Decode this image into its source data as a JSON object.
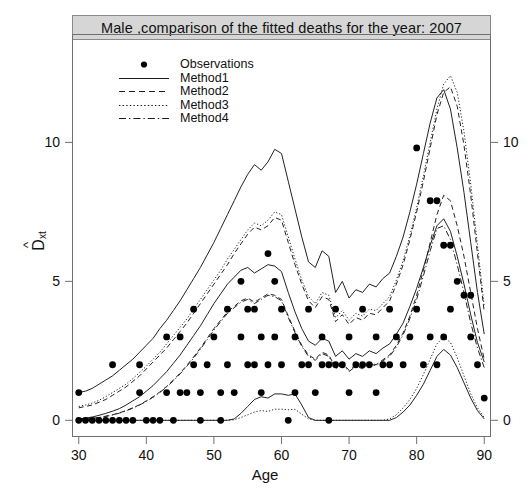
{
  "title": "Male ,comparison of the fitted deaths for the year: 2007",
  "legend": {
    "position": "top-left",
    "entries": [
      {
        "label": "Observations",
        "style": "point"
      },
      {
        "label": "Method1",
        "style": "solid"
      },
      {
        "label": "Method2",
        "style": "dashed"
      },
      {
        "label": "Method3",
        "style": "dotted"
      },
      {
        "label": "Method4",
        "style": "dashdot"
      }
    ]
  },
  "axes": {
    "x": {
      "label": "Age",
      "ticks": [
        30,
        40,
        50,
        60,
        70,
        80,
        90
      ],
      "min": 29,
      "max": 91
    },
    "y": {
      "label": "D_xt",
      "label_display": "D",
      "label_sub": "xt",
      "ticks": [
        0,
        5,
        10
      ],
      "min": -0.6,
      "max": 13.9
    },
    "y_right": {
      "ticks": [
        0,
        5,
        10
      ]
    }
  },
  "colors": {
    "title_bar": "#d6d6d6",
    "frame": "#6f6f6f",
    "line": "#222222",
    "point": "#000000",
    "background": "#ffffff"
  },
  "chart_data": {
    "type": "line",
    "title": "Male ,comparison of the fitted deaths for the year: 2007",
    "xlabel": "Age",
    "ylabel": "D_xt",
    "xlim": [
      29,
      91
    ],
    "ylim": [
      -0.6,
      13.9
    ],
    "grid": false,
    "legend_position": "top-left",
    "x": [
      30,
      31,
      32,
      33,
      34,
      35,
      36,
      37,
      38,
      39,
      40,
      41,
      42,
      43,
      44,
      45,
      46,
      47,
      48,
      49,
      50,
      51,
      52,
      53,
      54,
      55,
      56,
      57,
      58,
      59,
      60,
      61,
      62,
      63,
      64,
      65,
      66,
      67,
      68,
      69,
      70,
      71,
      72,
      73,
      74,
      75,
      76,
      77,
      78,
      79,
      80,
      81,
      82,
      83,
      84,
      85,
      86,
      87,
      88,
      89,
      90
    ],
    "series": [
      {
        "name": "Method1-upper",
        "style": "solid",
        "values": [
          1.0,
          1.05,
          1.15,
          1.3,
          1.45,
          1.6,
          1.8,
          2.0,
          2.2,
          2.45,
          2.7,
          2.95,
          3.3,
          3.6,
          3.95,
          4.3,
          4.7,
          5.1,
          5.5,
          5.95,
          6.4,
          6.9,
          7.4,
          7.9,
          8.4,
          8.85,
          9.2,
          9.0,
          9.3,
          9.75,
          9.6,
          8.6,
          7.6,
          6.6,
          5.7,
          5.5,
          6.1,
          5.9,
          4.6,
          5.0,
          4.4,
          4.7,
          4.6,
          4.9,
          4.8,
          5.1,
          5.3,
          5.9,
          6.6,
          7.5,
          8.5,
          9.6,
          10.7,
          11.6,
          11.9,
          11.2,
          9.8,
          8.2,
          6.4,
          4.6,
          3.1
        ]
      },
      {
        "name": "Method2-upper",
        "style": "dashed",
        "values": [
          0.45,
          0.5,
          0.55,
          0.65,
          0.75,
          0.9,
          1.05,
          1.2,
          1.4,
          1.6,
          1.85,
          2.1,
          2.35,
          2.6,
          2.9,
          3.2,
          3.5,
          3.85,
          4.2,
          4.55,
          4.9,
          5.25,
          5.6,
          6.0,
          6.35,
          6.7,
          6.95,
          6.85,
          7.0,
          7.3,
          7.2,
          6.4,
          5.6,
          4.9,
          4.3,
          4.05,
          4.45,
          4.35,
          3.55,
          3.8,
          3.45,
          3.7,
          3.6,
          3.85,
          3.8,
          4.05,
          4.3,
          4.9,
          5.6,
          6.5,
          7.5,
          8.6,
          9.8,
          11.0,
          11.8,
          12.0,
          11.3,
          9.9,
          8.1,
          6.0,
          3.9
        ]
      },
      {
        "name": "Method3-upper",
        "style": "dotted",
        "values": [
          0.5,
          0.55,
          0.62,
          0.72,
          0.85,
          1.0,
          1.15,
          1.3,
          1.5,
          1.72,
          1.95,
          2.2,
          2.45,
          2.75,
          3.05,
          3.35,
          3.65,
          4.0,
          4.35,
          4.7,
          5.05,
          5.4,
          5.8,
          6.15,
          6.5,
          6.85,
          7.1,
          7.0,
          7.2,
          7.5,
          7.4,
          6.6,
          5.8,
          5.05,
          4.45,
          4.2,
          4.6,
          4.5,
          3.7,
          3.95,
          3.6,
          3.85,
          3.75,
          4.0,
          3.95,
          4.2,
          4.45,
          5.05,
          5.75,
          6.65,
          7.65,
          8.8,
          10.0,
          11.2,
          12.1,
          12.4,
          11.8,
          10.4,
          8.5,
          6.3,
          4.1
        ]
      },
      {
        "name": "Method1-fit",
        "style": "solid",
        "values": [
          0.05,
          0.08,
          0.12,
          0.18,
          0.25,
          0.33,
          0.42,
          0.55,
          0.7,
          0.85,
          1.05,
          1.25,
          1.5,
          1.75,
          2.05,
          2.35,
          2.7,
          3.05,
          3.4,
          3.8,
          4.2,
          4.55,
          4.9,
          5.15,
          5.4,
          5.5,
          5.3,
          5.45,
          5.6,
          5.55,
          5.35,
          4.6,
          3.9,
          3.3,
          2.85,
          2.7,
          2.95,
          2.85,
          2.3,
          2.5,
          2.2,
          2.4,
          2.3,
          2.5,
          2.4,
          2.6,
          2.75,
          3.1,
          3.5,
          4.1,
          4.75,
          5.5,
          6.3,
          7.0,
          7.25,
          6.8,
          5.9,
          4.9,
          3.8,
          2.8,
          2.1
        ]
      },
      {
        "name": "Method2-fit",
        "style": "dashed",
        "values": [
          0.02,
          0.04,
          0.07,
          0.1,
          0.15,
          0.2,
          0.27,
          0.35,
          0.45,
          0.56,
          0.7,
          0.85,
          1.02,
          1.22,
          1.45,
          1.7,
          1.98,
          2.28,
          2.6,
          2.95,
          3.3,
          3.6,
          3.9,
          4.1,
          4.3,
          4.4,
          4.25,
          4.4,
          4.55,
          4.5,
          4.35,
          3.75,
          3.2,
          2.7,
          2.35,
          2.2,
          2.45,
          2.35,
          1.9,
          2.05,
          1.8,
          1.98,
          1.9,
          2.08,
          2.0,
          2.18,
          2.35,
          2.7,
          3.15,
          3.75,
          4.5,
          5.4,
          6.4,
          7.4,
          8.1,
          7.9,
          7.0,
          5.9,
          4.6,
          3.3,
          2.2
        ]
      },
      {
        "name": "Method4-fit",
        "style": "dashdot",
        "values": [
          0.02,
          0.04,
          0.07,
          0.1,
          0.14,
          0.19,
          0.26,
          0.34,
          0.44,
          0.55,
          0.68,
          0.83,
          1.0,
          1.2,
          1.42,
          1.67,
          1.95,
          2.24,
          2.56,
          2.9,
          3.25,
          3.55,
          3.85,
          4.05,
          4.25,
          4.35,
          4.2,
          4.35,
          4.5,
          4.45,
          4.3,
          3.7,
          3.15,
          2.66,
          2.3,
          2.16,
          2.4,
          2.3,
          1.86,
          2.0,
          1.76,
          1.94,
          1.86,
          2.04,
          1.96,
          2.14,
          2.3,
          2.64,
          3.08,
          3.66,
          4.35,
          5.2,
          6.1,
          6.9,
          7.0,
          6.5,
          5.6,
          4.6,
          3.5,
          2.6,
          1.9
        ]
      },
      {
        "name": "Method1-lower",
        "style": "solid",
        "values": [
          0,
          0,
          0,
          0,
          0,
          0,
          0,
          0,
          0,
          0,
          0,
          0,
          0,
          0,
          0,
          0,
          0,
          0,
          0,
          0,
          0,
          0,
          0,
          0.05,
          0.25,
          0.5,
          0.75,
          0.85,
          0.8,
          0.95,
          0.95,
          0.9,
          0.95,
          0.55,
          0.1,
          0,
          0,
          0,
          0,
          0,
          0,
          0,
          0,
          0,
          0,
          0,
          0,
          0.1,
          0.3,
          0.55,
          0.9,
          1.3,
          1.8,
          2.3,
          2.55,
          2.35,
          1.9,
          1.35,
          0.8,
          0.35,
          0.05
        ]
      },
      {
        "name": "Method3-lower",
        "style": "dotted",
        "values": [
          0,
          0,
          0,
          0,
          0,
          0,
          0,
          0,
          0,
          0,
          0,
          0,
          0,
          0,
          0,
          0,
          0,
          0,
          0,
          0,
          0,
          0,
          0,
          0.02,
          0.1,
          0.2,
          0.3,
          0.35,
          0.32,
          0.4,
          0.4,
          0.38,
          0.4,
          0.22,
          0.05,
          0,
          0,
          0,
          0,
          0,
          0,
          0,
          0,
          0,
          0,
          0,
          0.05,
          0.2,
          0.45,
          0.75,
          1.15,
          1.65,
          2.2,
          2.75,
          3.0,
          2.8,
          2.25,
          1.6,
          0.95,
          0.45,
          0.1
        ]
      }
    ],
    "observations": {
      "name": "Observations",
      "style": "point",
      "points": [
        [
          30,
          1.0
        ],
        [
          30,
          0.0
        ],
        [
          31,
          0.0
        ],
        [
          32,
          0.0
        ],
        [
          33,
          0.0
        ],
        [
          34,
          0.0
        ],
        [
          35,
          2.0
        ],
        [
          35,
          0.0
        ],
        [
          36,
          0.0
        ],
        [
          37,
          0.0
        ],
        [
          38,
          0.0
        ],
        [
          39,
          2.0
        ],
        [
          39,
          1.0
        ],
        [
          40,
          0.0
        ],
        [
          41,
          0.0
        ],
        [
          42,
          0.0
        ],
        [
          43,
          3.0
        ],
        [
          43,
          1.0
        ],
        [
          44,
          0.0
        ],
        [
          45,
          3.0
        ],
        [
          45,
          1.0
        ],
        [
          46,
          1.0
        ],
        [
          47,
          4.0
        ],
        [
          47,
          2.0
        ],
        [
          48,
          0.0
        ],
        [
          48,
          1.0
        ],
        [
          49,
          2.0
        ],
        [
          50,
          3.0
        ],
        [
          51,
          0.0
        ],
        [
          51,
          1.0
        ],
        [
          52,
          2.0
        ],
        [
          52,
          4.0
        ],
        [
          53,
          1.0
        ],
        [
          54,
          5.0
        ],
        [
          54,
          3.0
        ],
        [
          55,
          4.0
        ],
        [
          55,
          2.0
        ],
        [
          56,
          4.0
        ],
        [
          56,
          2.0
        ],
        [
          57,
          3.0
        ],
        [
          57,
          1.0
        ],
        [
          58,
          6.0
        ],
        [
          58,
          2.0
        ],
        [
          59,
          5.0
        ],
        [
          59,
          3.0
        ],
        [
          60,
          4.0
        ],
        [
          60,
          2.0
        ],
        [
          61,
          0.0
        ],
        [
          62,
          3.0
        ],
        [
          62,
          1.0
        ],
        [
          63,
          2.0
        ],
        [
          64,
          4.0
        ],
        [
          64,
          2.0
        ],
        [
          65,
          1.0
        ],
        [
          66,
          3.0
        ],
        [
          66,
          2.0
        ],
        [
          67,
          2.0
        ],
        [
          67,
          0.0
        ],
        [
          68,
          4.0
        ],
        [
          68,
          2.0
        ],
        [
          69,
          2.0
        ],
        [
          70,
          3.0
        ],
        [
          70,
          1.0
        ],
        [
          71,
          2.0
        ],
        [
          72,
          4.0
        ],
        [
          72,
          2.0
        ],
        [
          73,
          2.0
        ],
        [
          74,
          3.0
        ],
        [
          74,
          1.0
        ],
        [
          75,
          2.0
        ],
        [
          76,
          4.0
        ],
        [
          76,
          2.0
        ],
        [
          77,
          3.0
        ],
        [
          78,
          2.0
        ],
        [
          79,
          3.0
        ],
        [
          80,
          9.8
        ],
        [
          80,
          4.0
        ],
        [
          81,
          2.0
        ],
        [
          82,
          7.9
        ],
        [
          82,
          3.0
        ],
        [
          83,
          7.9
        ],
        [
          83,
          2.0
        ],
        [
          84,
          6.3
        ],
        [
          84,
          3.0
        ],
        [
          85,
          6.3
        ],
        [
          85,
          4.0
        ],
        [
          86,
          5.0
        ],
        [
          87,
          4.5
        ],
        [
          88,
          4.5
        ],
        [
          88,
          3.0
        ],
        [
          89,
          2.0
        ],
        [
          90,
          0.8
        ]
      ]
    }
  }
}
